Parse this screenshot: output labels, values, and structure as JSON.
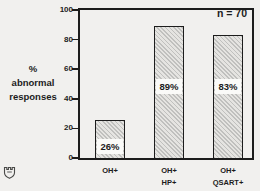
{
  "figure": {
    "n_annotation": "n = 70",
    "y_axis_title_lines": [
      "%",
      "abnormal",
      "responses"
    ]
  },
  "chart_data": {
    "type": "bar",
    "title": "",
    "ylabel": "% abnormal responses",
    "xlabel": "",
    "ylim": [
      0,
      100
    ],
    "yticks": [
      0,
      20,
      40,
      60,
      80,
      100
    ],
    "categories": [
      "OH+",
      "OH+ HP+",
      "OH+ QSART+"
    ],
    "category_lines": [
      [
        "OH+"
      ],
      [
        "OH+",
        "HP+"
      ],
      [
        "OH+",
        "QSART+"
      ]
    ],
    "values": [
      26,
      89,
      83
    ],
    "bar_value_labels": [
      "26%",
      "89%",
      "83%"
    ],
    "annotation": "n = 70",
    "grid": false,
    "legend": null,
    "bar_fill": "diagonal-hatch"
  },
  "colors": {
    "background": "#f1f0ee",
    "ink": "#1c1c1c",
    "bar_hatch_dark": "#c0c0be",
    "bar_hatch_light": "#e5e4e1",
    "label_box": "#fafaf8"
  },
  "icons": {
    "watermark": "crest-icon"
  }
}
